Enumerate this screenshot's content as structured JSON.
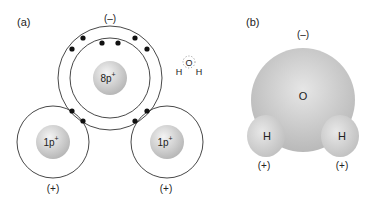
{
  "panel_a": {
    "label": "(a)",
    "oxygen_charge": "(–)",
    "oxygen_nucleus": "8p",
    "hydrogen_left_nucleus": "1p",
    "hydrogen_right_nucleus": "1p",
    "plus_sup": "+",
    "hydrogen_left_charge": "(+)",
    "hydrogen_right_charge": "(+)",
    "inset": {
      "o": "O",
      "h_left": "H",
      "h_right": "H"
    }
  },
  "panel_b": {
    "label": "(b)",
    "charge_top": "(–)",
    "oxygen": "O",
    "h_left": "H",
    "h_right": "H",
    "charge_left": "(+)",
    "charge_right": "(+)"
  }
}
